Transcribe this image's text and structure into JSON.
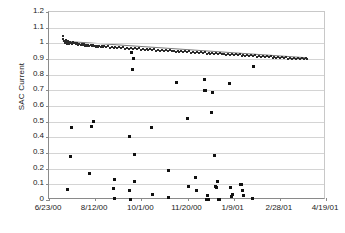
{
  "chart_data": {
    "type": "scatter",
    "title": "",
    "xlabel": "",
    "ylabel": "SAC Current",
    "ylim": [
      0,
      1.2
    ],
    "ytick_step": 0.1,
    "grid": true,
    "legend": "none",
    "xlim": [
      "6/23/00",
      "4/19/01"
    ],
    "xtick_labels": [
      "6/23/00",
      "8/12/00",
      "10/1/00",
      "11/20/00",
      "1/9/01",
      "2/28/01",
      "4/19/01"
    ],
    "ytick_labels": [
      "1.2",
      "1.1",
      "1",
      "0.9",
      "0.8",
      "0.7",
      "0.6",
      "0.5",
      "0.4",
      "0.3",
      "0.2",
      "0.1",
      "0"
    ],
    "series": [
      {
        "name": "SAC Current main band",
        "description": "Dense near-daily cluster declining from about 1.04 to 0.90",
        "points": [
          [
            0.05,
            1.045
          ],
          [
            0.052,
            1.03
          ],
          [
            0.054,
            1.018
          ],
          [
            0.056,
            1.01
          ],
          [
            0.058,
            1.002
          ],
          [
            0.06,
            1.022
          ],
          [
            0.062,
            1.012
          ],
          [
            0.064,
            1.004
          ],
          [
            0.066,
            0.998
          ],
          [
            0.068,
            1.014
          ],
          [
            0.07,
            1.008
          ],
          [
            0.072,
            1.0
          ],
          [
            0.074,
            0.996
          ],
          [
            0.076,
            1.01
          ],
          [
            0.078,
            1.004
          ],
          [
            0.082,
            0.998
          ],
          [
            0.086,
            1.006
          ],
          [
            0.09,
            0.999
          ],
          [
            0.094,
            1.002
          ],
          [
            0.098,
            0.994
          ],
          [
            0.102,
            1.0
          ],
          [
            0.106,
            0.992
          ],
          [
            0.11,
            0.998
          ],
          [
            0.114,
            0.99
          ],
          [
            0.118,
            0.996
          ],
          [
            0.122,
            0.988
          ],
          [
            0.126,
            0.994
          ],
          [
            0.13,
            0.986
          ],
          [
            0.134,
            0.992
          ],
          [
            0.138,
            0.984
          ],
          [
            0.142,
            0.99
          ],
          [
            0.146,
            0.983
          ],
          [
            0.15,
            0.989
          ],
          [
            0.154,
            0.981
          ],
          [
            0.158,
            0.987
          ],
          [
            0.162,
            0.98
          ],
          [
            0.166,
            0.986
          ],
          [
            0.17,
            0.978
          ],
          [
            0.174,
            0.984
          ],
          [
            0.178,
            0.977
          ],
          [
            0.182,
            0.983
          ],
          [
            0.186,
            0.976
          ],
          [
            0.19,
            0.982
          ],
          [
            0.194,
            0.975
          ],
          [
            0.198,
            0.981
          ],
          [
            0.205,
            0.974
          ],
          [
            0.212,
            0.98
          ],
          [
            0.219,
            0.972
          ],
          [
            0.226,
            0.978
          ],
          [
            0.233,
            0.971
          ],
          [
            0.24,
            0.977
          ],
          [
            0.247,
            0.969
          ],
          [
            0.254,
            0.975
          ],
          [
            0.261,
            0.968
          ],
          [
            0.268,
            0.974
          ],
          [
            0.275,
            0.966
          ],
          [
            0.282,
            0.972
          ],
          [
            0.289,
            0.965
          ],
          [
            0.296,
            0.971
          ],
          [
            0.303,
            0.963
          ],
          [
            0.31,
            0.969
          ],
          [
            0.317,
            0.962
          ],
          [
            0.324,
            0.968
          ],
          [
            0.331,
            0.96
          ],
          [
            0.338,
            0.966
          ],
          [
            0.345,
            0.959
          ],
          [
            0.352,
            0.965
          ],
          [
            0.359,
            0.957
          ],
          [
            0.366,
            0.963
          ],
          [
            0.373,
            0.956
          ],
          [
            0.38,
            0.962
          ],
          [
            0.387,
            0.954
          ],
          [
            0.394,
            0.96
          ],
          [
            0.401,
            0.953
          ],
          [
            0.408,
            0.959
          ],
          [
            0.415,
            0.951
          ],
          [
            0.422,
            0.957
          ],
          [
            0.429,
            0.95
          ],
          [
            0.436,
            0.956
          ],
          [
            0.443,
            0.948
          ],
          [
            0.45,
            0.954
          ],
          [
            0.457,
            0.947
          ],
          [
            0.464,
            0.953
          ],
          [
            0.471,
            0.945
          ],
          [
            0.478,
            0.951
          ],
          [
            0.485,
            0.944
          ],
          [
            0.492,
            0.95
          ],
          [
            0.499,
            0.942
          ],
          [
            0.506,
            0.948
          ],
          [
            0.513,
            0.941
          ],
          [
            0.52,
            0.947
          ],
          [
            0.527,
            0.939
          ],
          [
            0.534,
            0.945
          ],
          [
            0.541,
            0.938
          ],
          [
            0.548,
            0.944
          ],
          [
            0.555,
            0.936
          ],
          [
            0.562,
            0.942
          ],
          [
            0.569,
            0.935
          ],
          [
            0.576,
            0.941
          ],
          [
            0.583,
            0.933
          ],
          [
            0.59,
            0.939
          ],
          [
            0.597,
            0.932
          ],
          [
            0.604,
            0.938
          ],
          [
            0.611,
            0.93
          ],
          [
            0.618,
            0.936
          ],
          [
            0.625,
            0.929
          ],
          [
            0.632,
            0.935
          ],
          [
            0.639,
            0.927
          ],
          [
            0.646,
            0.933
          ],
          [
            0.653,
            0.926
          ],
          [
            0.66,
            0.932
          ],
          [
            0.667,
            0.924
          ],
          [
            0.674,
            0.93
          ],
          [
            0.681,
            0.923
          ],
          [
            0.688,
            0.929
          ],
          [
            0.695,
            0.921
          ],
          [
            0.702,
            0.927
          ],
          [
            0.709,
            0.92
          ],
          [
            0.716,
            0.926
          ],
          [
            0.723,
            0.918
          ],
          [
            0.73,
            0.924
          ],
          [
            0.737,
            0.917
          ],
          [
            0.744,
            0.923
          ],
          [
            0.751,
            0.915
          ],
          [
            0.758,
            0.921
          ],
          [
            0.765,
            0.914
          ],
          [
            0.772,
            0.92
          ],
          [
            0.779,
            0.912
          ],
          [
            0.786,
            0.918
          ],
          [
            0.793,
            0.911
          ],
          [
            0.8,
            0.917
          ],
          [
            0.807,
            0.909
          ],
          [
            0.814,
            0.915
          ],
          [
            0.821,
            0.908
          ],
          [
            0.828,
            0.914
          ],
          [
            0.835,
            0.906
          ],
          [
            0.842,
            0.912
          ],
          [
            0.849,
            0.905
          ],
          [
            0.856,
            0.911
          ],
          [
            0.863,
            0.903
          ],
          [
            0.87,
            0.909
          ],
          [
            0.877,
            0.902
          ],
          [
            0.884,
            0.908
          ],
          [
            0.891,
            0.9
          ],
          [
            0.898,
            0.906
          ],
          [
            0.905,
            0.899
          ],
          [
            0.912,
            0.905
          ],
          [
            0.919,
            0.901
          ],
          [
            0.926,
            0.904
          ],
          [
            0.933,
            0.9
          ]
        ]
      },
      {
        "name": "SAC Current outliers",
        "description": "Sparse low and mid-range readings scattered below the band",
        "points": [
          [
            0.068,
            0.068
          ],
          [
            0.078,
            0.277
          ],
          [
            0.08,
            0.46
          ],
          [
            0.155,
            0.468
          ],
          [
            0.16,
            0.498
          ],
          [
            0.148,
            0.172
          ],
          [
            0.235,
            0.134
          ],
          [
            0.233,
            0.076
          ],
          [
            0.238,
            0.008
          ],
          [
            0.297,
            0.944
          ],
          [
            0.3,
            0.83
          ],
          [
            0.305,
            0.905
          ],
          [
            0.292,
            0.405
          ],
          [
            0.289,
            0.063
          ],
          [
            0.293,
            0.004
          ],
          [
            0.296,
            0.002
          ],
          [
            0.31,
            0.118
          ],
          [
            0.308,
            0.292
          ],
          [
            0.37,
            0.462
          ],
          [
            0.372,
            0.037
          ],
          [
            0.43,
            0.188
          ],
          [
            0.432,
            0.017
          ],
          [
            0.46,
            0.748
          ],
          [
            0.5,
            0.518
          ],
          [
            0.505,
            0.086
          ],
          [
            0.53,
            0.146
          ],
          [
            0.533,
            0.063
          ],
          [
            0.56,
            0.768
          ],
          [
            0.563,
            0.7
          ],
          [
            0.566,
            0.697
          ],
          [
            0.568,
            0.006
          ],
          [
            0.572,
            0.03
          ],
          [
            0.575,
            0.002
          ],
          [
            0.588,
            0.559
          ],
          [
            0.592,
            0.688
          ],
          [
            0.596,
            0.287
          ],
          [
            0.6,
            0.088
          ],
          [
            0.604,
            0.078
          ],
          [
            0.608,
            0.115
          ],
          [
            0.612,
            0.006
          ],
          [
            0.616,
            0.003
          ],
          [
            0.65,
            0.742
          ],
          [
            0.654,
            0.078
          ],
          [
            0.658,
            0.022
          ],
          [
            0.662,
            0.038
          ],
          [
            0.69,
            0.098
          ],
          [
            0.694,
            0.1
          ],
          [
            0.698,
            0.062
          ],
          [
            0.702,
            0.03
          ],
          [
            0.74,
            0.852
          ],
          [
            0.736,
            0.008
          ]
        ]
      }
    ],
    "trendline": {
      "name": "linear fit through main band",
      "start": [
        0.05,
        1.012
      ],
      "end": [
        0.935,
        0.905
      ],
      "color": "#777777"
    }
  }
}
